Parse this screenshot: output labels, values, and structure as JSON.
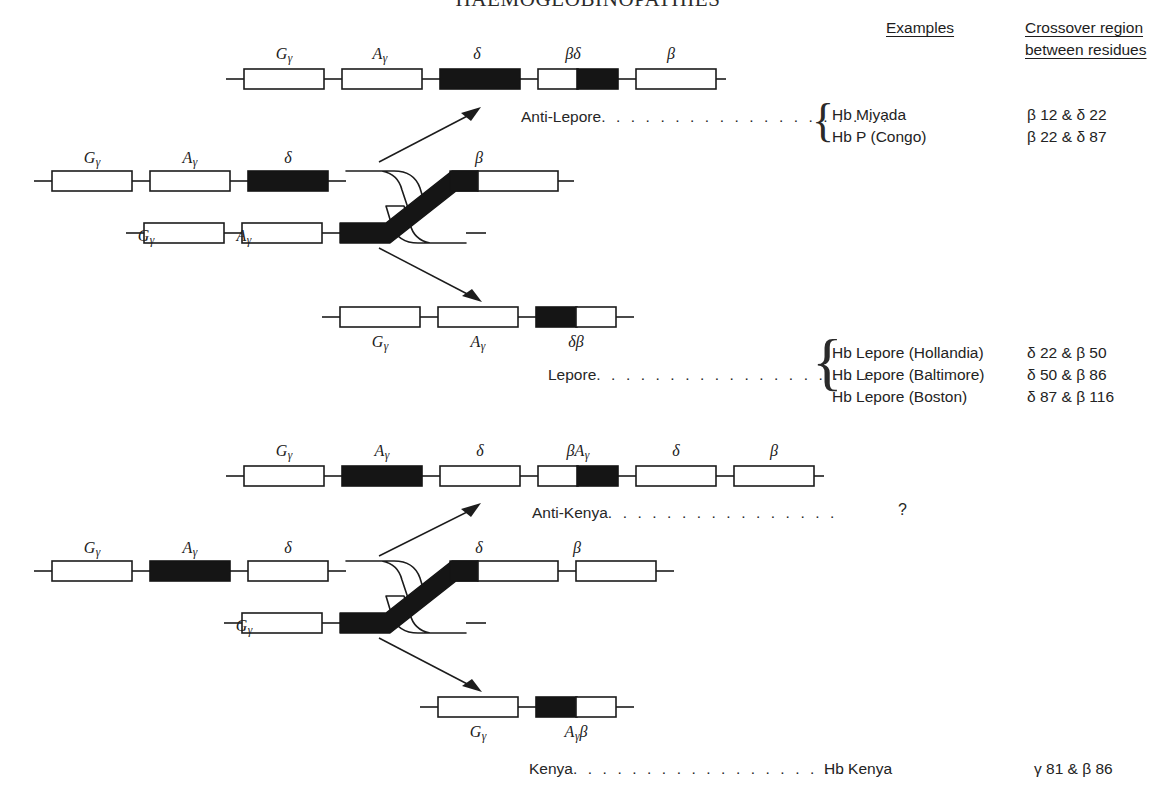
{
  "page": {
    "title": "HAEMOGLOBINOPATHIES",
    "background": "#ffffff",
    "ink": "#1a1a1a"
  },
  "headers": {
    "examples": "Examples",
    "crossover_line1": "Crossover region",
    "crossover_line2": "between residues"
  },
  "gene_labels": {
    "G_gamma": "Gγ",
    "A_gamma": "Aγ",
    "delta": "δ",
    "beta": "β",
    "beta_delta": "βδ",
    "delta_beta": "δβ",
    "beta_A_gamma": "βAγ",
    "A_gamma_beta": "Aγβ"
  },
  "diagram_lepore": {
    "name": "lepore-crossover-diagram",
    "anti_product": {
      "name": "anti-lepore-chromosome",
      "genes": [
        {
          "label": "Gγ",
          "fill": "white"
        },
        {
          "label": "Aγ",
          "fill": "white"
        },
        {
          "label": "δ",
          "fill": "black"
        },
        {
          "label": "βδ",
          "fill": "split-white-black"
        },
        {
          "label": "β",
          "fill": "white"
        }
      ]
    },
    "parent_upper": {
      "name": "parent-chromosome-upper",
      "genes": [
        {
          "label": "Gγ",
          "fill": "white"
        },
        {
          "label": "Aγ",
          "fill": "white"
        },
        {
          "label": "δ",
          "fill": "black"
        },
        {
          "label": "",
          "fill": "crossover"
        },
        {
          "label": "β",
          "fill": "white"
        }
      ]
    },
    "parent_lower": {
      "name": "parent-chromosome-lower",
      "genes": [
        {
          "label": "Gγ",
          "fill": "white"
        },
        {
          "label": "Aγ",
          "fill": "white"
        },
        {
          "label": "",
          "fill": "crossover"
        }
      ]
    },
    "product": {
      "name": "lepore-chromosome",
      "genes": [
        {
          "label": "Gγ",
          "fill": "white"
        },
        {
          "label": "Aγ",
          "fill": "white"
        },
        {
          "label": "δβ",
          "fill": "split-black-white"
        }
      ]
    },
    "anti_path_label": "Anti-Lepore",
    "path_label": "Lepore",
    "anti_examples": [
      {
        "name": "Hb Miyada",
        "crossover": "β 12 & δ 22"
      },
      {
        "name": "Hb P (Congo)",
        "crossover": "β 22 & δ 87"
      }
    ],
    "examples": [
      {
        "name": "Hb Lepore (Hollandia)",
        "crossover": "δ 22 & β 50"
      },
      {
        "name": "Hb Lepore (Baltimore)",
        "crossover": "δ 50 & β 86"
      },
      {
        "name": "Hb Lepore (Boston)",
        "crossover": "δ 87 & β 116"
      }
    ]
  },
  "diagram_kenya": {
    "name": "kenya-crossover-diagram",
    "anti_product": {
      "name": "anti-kenya-chromosome",
      "genes": [
        {
          "label": "Gγ",
          "fill": "white"
        },
        {
          "label": "Aγ",
          "fill": "black"
        },
        {
          "label": "δ",
          "fill": "white"
        },
        {
          "label": "βAγ",
          "fill": "split-white-black"
        },
        {
          "label": "δ",
          "fill": "white"
        },
        {
          "label": "β",
          "fill": "white"
        }
      ]
    },
    "parent_upper": {
      "name": "parent-chromosome-upper",
      "genes": [
        {
          "label": "Gγ",
          "fill": "white"
        },
        {
          "label": "Aγ",
          "fill": "black"
        },
        {
          "label": "δ",
          "fill": "white"
        },
        {
          "label": "",
          "fill": "crossover"
        },
        {
          "label": "δ",
          "fill": "white"
        },
        {
          "label": "β",
          "fill": "white"
        }
      ]
    },
    "parent_lower": {
      "name": "parent-chromosome-lower",
      "genes": [
        {
          "label": "Gγ",
          "fill": "white"
        },
        {
          "label": "",
          "fill": "crossover"
        }
      ]
    },
    "product": {
      "name": "kenya-chromosome",
      "genes": [
        {
          "label": "Gγ",
          "fill": "white"
        },
        {
          "label": "Aγβ",
          "fill": "split-black-white"
        }
      ]
    },
    "anti_path_label": "Anti-Kenya",
    "path_label": "Kenya",
    "anti_examples": [
      {
        "name": "?",
        "crossover": ""
      }
    ],
    "examples": [
      {
        "name": "Hb Kenya",
        "crossover": "γ 81 & β 86"
      }
    ]
  },
  "dots": {
    "short": ". . . . . . . . . . . . . . . .",
    "medium": ". . . . . . . . . . . . . . . . . . .",
    "long": ". . . . . . . . . . . . . . . . . . . ."
  }
}
